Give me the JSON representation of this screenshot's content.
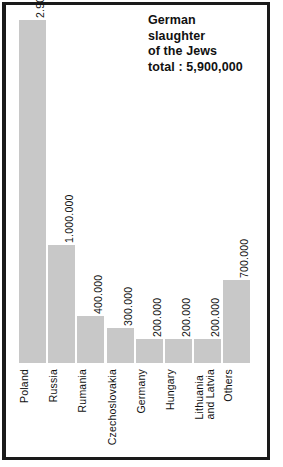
{
  "title": {
    "line1": "German",
    "line2": "slaughter",
    "line3": "of the Jews",
    "line4": "total : 5,900,000"
  },
  "colors": {
    "bar_fill": "#c8c8c8",
    "frame": "#1a1a1a",
    "text": "#111111",
    "background": "#ffffff"
  },
  "chart_data": {
    "type": "bar",
    "title": "German slaughter of the Jews total : 5,900,000",
    "xlabel": "",
    "ylabel": "",
    "ylim": [
      0,
      2900000
    ],
    "grid": false,
    "legend": false,
    "categories": [
      "Poland",
      "Russia",
      "Rumania",
      "Czechoslovakia",
      "Germany",
      "Hungary",
      "Lithuania and Latvia",
      "Others"
    ],
    "values": [
      2900000,
      1000000,
      400000,
      300000,
      200000,
      200000,
      200000,
      700000
    ],
    "value_labels": [
      "2.900.000",
      "1.000.000",
      "400.000",
      "300.000",
      "200.000",
      "200.000",
      "200.000",
      "700.000"
    ],
    "total": 5900000,
    "total_label": "5,900,000"
  },
  "bars": [
    {
      "category": "Poland",
      "label_lines": [
        "Poland"
      ],
      "value_label": "2.900.000",
      "value": 2900000
    },
    {
      "category": "Russia",
      "label_lines": [
        "Russia"
      ],
      "value_label": "1.000.000",
      "value": 1000000
    },
    {
      "category": "Rumania",
      "label_lines": [
        "Rumania"
      ],
      "value_label": "400.000",
      "value": 400000
    },
    {
      "category": "Czechoslovakia",
      "label_lines": [
        "Czechoslovakia"
      ],
      "value_label": "300.000",
      "value": 300000
    },
    {
      "category": "Germany",
      "label_lines": [
        "Germany"
      ],
      "value_label": "200.000",
      "value": 200000
    },
    {
      "category": "Hungary",
      "label_lines": [
        "Hungary"
      ],
      "value_label": "200.000",
      "value": 200000
    },
    {
      "category": "Lithuania and Latvia",
      "label_lines": [
        "Lithuania",
        "and Latvia"
      ],
      "value_label": "200.000",
      "value": 200000
    },
    {
      "category": "Others",
      "label_lines": [
        "Others"
      ],
      "value_label": "700.000",
      "value": 700000
    }
  ]
}
